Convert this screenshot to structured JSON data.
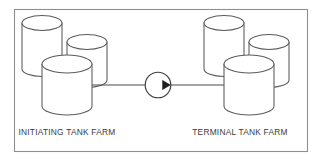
{
  "diagram": {
    "background_color": "#ffffff",
    "frame": {
      "name": "diagram-border",
      "stroke_color": "#8f8f8f",
      "x": 14,
      "y": 9,
      "width": 294,
      "height": 143
    },
    "labels": {
      "left_farm": "INITIATING TANK FARM",
      "right_farm": "TERMINAL TANK FARM"
    },
    "left_farm": {
      "name": "initiating-tank-farm",
      "tank_count": 3,
      "tanks": [
        {
          "name": "tank-back-left",
          "cx": 42,
          "top_y": 23,
          "rx": 20,
          "ry": 7.5,
          "height": 53
        },
        {
          "name": "tank-back-right",
          "cx": 87,
          "top_y": 42,
          "rx": 20,
          "ry": 7.5,
          "height": 45
        },
        {
          "name": "tank-front",
          "cx": 67,
          "top_y": 64,
          "rx": 25,
          "ry": 9,
          "height": 42
        }
      ]
    },
    "right_farm": {
      "name": "terminal-tank-farm",
      "tank_count": 3,
      "tanks": [
        {
          "name": "tank-back-left",
          "cx": 224,
          "top_y": 23,
          "rx": 20,
          "ry": 7.5,
          "height": 53
        },
        {
          "name": "tank-back-right",
          "cx": 269,
          "top_y": 42,
          "rx": 20,
          "ry": 7.5,
          "height": 45
        },
        {
          "name": "tank-front",
          "cx": 249,
          "top_y": 64,
          "rx": 25,
          "ry": 9,
          "height": 42
        }
      ]
    },
    "pipeline": {
      "name": "transfer-pipeline",
      "y": 85,
      "start_x": 92,
      "end_x": 224,
      "direction": "left-to-right",
      "stroke_color": "#4a4a4a"
    },
    "valve": {
      "name": "flow-valve",
      "cx": 158,
      "cy": 85,
      "r": 13,
      "arrow_direction": "right",
      "arrow_color": "#1d1d1d"
    }
  }
}
